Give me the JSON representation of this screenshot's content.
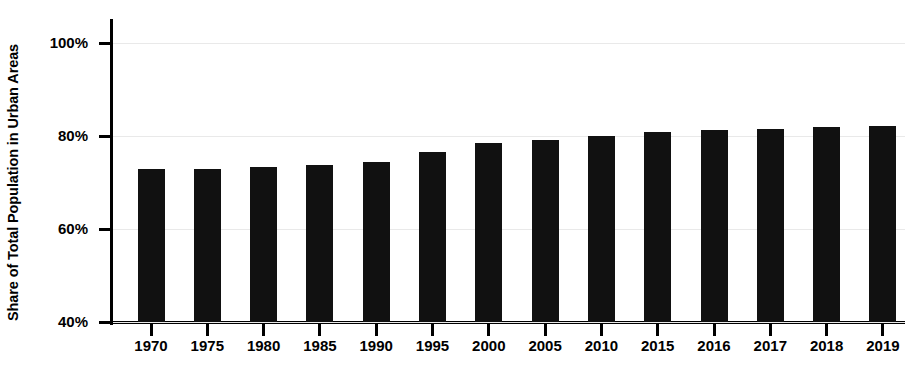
{
  "chart_data": {
    "type": "bar",
    "title": "",
    "xlabel": "",
    "ylabel": "Share of Total Population in Urban Areas",
    "categories": [
      "1970",
      "1975",
      "1980",
      "1985",
      "1990",
      "1995",
      "2000",
      "2005",
      "2010",
      "2015",
      "2016",
      "2017",
      "2018",
      "2019"
    ],
    "values": [
      72.8,
      72.9,
      73.3,
      73.8,
      74.5,
      76.6,
      78.5,
      79.2,
      80.0,
      80.9,
      81.3,
      81.6,
      81.9,
      82.2
    ],
    "ylim": [
      40,
      100
    ],
    "ytick_labels": [
      "100%",
      "80%",
      "60%",
      "40%"
    ],
    "ytick_values": [
      100,
      80,
      60,
      40
    ],
    "grid": true,
    "legend": null,
    "bar_color": "#111111",
    "grid_color": "#e9e9e9",
    "axis_color": "#000000"
  }
}
